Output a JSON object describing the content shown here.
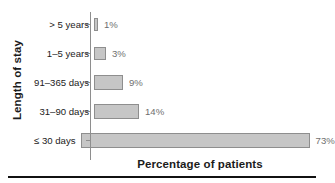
{
  "chart_data": {
    "type": "bar",
    "orientation": "horizontal",
    "title": "",
    "xlabel": "Percentage of patients",
    "ylabel": "Length of stay",
    "categories": [
      "> 5 years",
      "1–5 years",
      "91–365 days",
      "31–90 days",
      "≤ 30 days"
    ],
    "values": [
      1,
      3,
      9,
      14,
      73
    ],
    "value_labels": [
      "1%",
      "3%",
      "9%",
      "14%",
      "73%"
    ],
    "xlim": [
      0,
      73
    ],
    "grid": false,
    "legend": null,
    "bar_fill": "#c6c6c6",
    "bar_edge": "#8e8e8e",
    "label_color": "#6f6f6f",
    "axis_color": "#8e8e8e",
    "text_color": "#1b1b1b",
    "background": "#ffffff"
  },
  "figure": {
    "ylabel": "Length of stay",
    "xlabel": "Percentage of patients",
    "rows": [
      {
        "category": "> 5 years",
        "value_label": "1%",
        "bar_width_px": 4
      },
      {
        "category": "1–5 years",
        "value_label": "3%",
        "bar_width_px": 12
      },
      {
        "category": "91–365 days",
        "value_label": "9%",
        "bar_width_px": 29
      },
      {
        "category": "31–90 days",
        "value_label": "14%",
        "bar_width_px": 45
      },
      {
        "category": "≤ 30 days",
        "value_label": "73%",
        "bar_width_px": 229
      }
    ]
  }
}
